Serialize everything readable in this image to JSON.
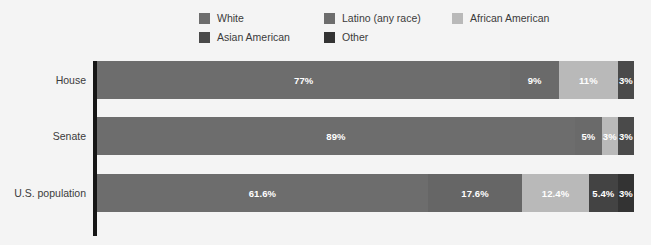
{
  "legend": {
    "rows": [
      [
        {
          "label": "White",
          "color": "#6d6d6d",
          "key": "white"
        },
        {
          "label": "Latino (any race)",
          "color": "#6d6d6d",
          "key": "latino"
        },
        {
          "label": "African American",
          "color": "#b9b9b9",
          "key": "african-american"
        }
      ],
      [
        {
          "label": "Asian American",
          "color": "#4a4a4a",
          "key": "asian-american"
        },
        {
          "label": "Other",
          "color": "#333333",
          "key": "other"
        }
      ]
    ]
  },
  "chart_data": {
    "type": "bar",
    "orientation": "horizontal",
    "stacked": true,
    "stack_total": 100,
    "title": "",
    "subtitle": "",
    "xlabel": "",
    "ylabel": "",
    "xlim": [
      0,
      100
    ],
    "grid": false,
    "legend_position": "top",
    "categories": [
      "House",
      "Senate",
      "U.S. population"
    ],
    "series": [
      {
        "name": "White",
        "color": "#6d6d6d",
        "values": [
          77,
          89,
          61.6
        ],
        "labels": [
          "77%",
          "89%",
          "61.6%"
        ]
      },
      {
        "name": "Latino (any race)",
        "color": "#6d6d6d",
        "values": [
          9,
          5,
          17.6
        ],
        "labels": [
          "9%",
          "5%",
          "17.6%"
        ]
      },
      {
        "name": "African American",
        "color": "#b9b9b9",
        "values": [
          11,
          3,
          12.4
        ],
        "labels": [
          "11%",
          "3%",
          "12.4%"
        ]
      },
      {
        "name": "Asian American",
        "color": "#4a4a4a",
        "values": [
          0,
          0,
          5.4
        ],
        "labels": [
          "",
          "",
          "5.4%"
        ]
      },
      {
        "name": "Other",
        "color": "#333333",
        "values": [
          3,
          3,
          3
        ],
        "labels": [
          "3%",
          "3%",
          "3%"
        ]
      }
    ],
    "rows": [
      {
        "category": "House",
        "segments": [
          {
            "series": "White",
            "value": 77,
            "label": "77%",
            "color": "#6d6d6d"
          },
          {
            "series": "Latino (any race)",
            "value": 9,
            "label": "9%",
            "color": "#6a6a6a"
          },
          {
            "series": "African American",
            "value": 11,
            "label": "11%",
            "color": "#b9b9b9"
          },
          {
            "series": "Other",
            "value": 3,
            "label": "3%",
            "color": "#4a4a4a"
          }
        ]
      },
      {
        "category": "Senate",
        "segments": [
          {
            "series": "White",
            "value": 89,
            "label": "89%",
            "color": "#6d6d6d"
          },
          {
            "series": "Latino (any race)",
            "value": 5,
            "label": "5%",
            "color": "#6a6a6a"
          },
          {
            "series": "African American",
            "value": 3,
            "label": "3%",
            "color": "#b9b9b9"
          },
          {
            "series": "Other",
            "value": 3,
            "label": "3%",
            "color": "#4a4a4a"
          }
        ]
      },
      {
        "category": "U.S. population",
        "segments": [
          {
            "series": "White",
            "value": 61.6,
            "label": "61.6%",
            "color": "#6d6d6d"
          },
          {
            "series": "Latino (any race)",
            "value": 17.6,
            "label": "17.6%",
            "color": "#666666"
          },
          {
            "series": "African American",
            "value": 12.4,
            "label": "12.4%",
            "color": "#b9b9b9"
          },
          {
            "series": "Asian American",
            "value": 5.4,
            "label": "5.4%",
            "color": "#434343"
          },
          {
            "series": "Other",
            "value": 3,
            "label": "3%",
            "color": "#333333"
          }
        ]
      }
    ]
  },
  "colors": {
    "background": "#f4f4f4",
    "axis": "#161616",
    "text": "#3b3b3b",
    "bar_label": "#ffffff",
    "white_series": "#6d6d6d",
    "latino_series": "#6a6a6a",
    "african_american_series": "#b9b9b9",
    "asian_american_series": "#434343",
    "other_series": "#333333"
  }
}
